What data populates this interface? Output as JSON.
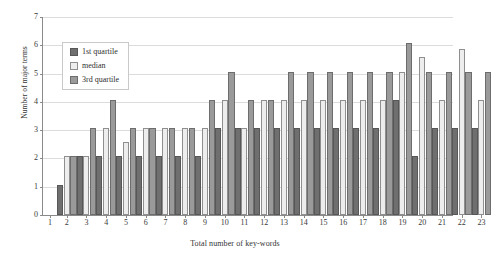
{
  "chart_data": {
    "type": "bar",
    "title": "",
    "xlabel": "Total number of key-words",
    "ylabel": "Number of major terms",
    "categories": [
      1,
      2,
      3,
      4,
      5,
      6,
      7,
      8,
      9,
      10,
      11,
      12,
      13,
      14,
      15,
      16,
      17,
      18,
      19,
      20,
      21,
      22,
      23
    ],
    "ylim": [
      0,
      7
    ],
    "yticks": [
      0,
      1,
      2,
      3,
      4,
      5,
      6,
      7
    ],
    "grid": true,
    "legend_position": "upper-left-inside",
    "series": [
      {
        "name": "1st quartile",
        "color": "#6f6f6f",
        "values": [
          0,
          1,
          2,
          2,
          2,
          2,
          2,
          2,
          2,
          3,
          3,
          3,
          3,
          3,
          3,
          3,
          3,
          3,
          4,
          2,
          3,
          3,
          3
        ]
      },
      {
        "name": "median",
        "color": "#ededed",
        "values": [
          0,
          2,
          2,
          3,
          2.5,
          3,
          3,
          3,
          3,
          4,
          3,
          4,
          4,
          4,
          4,
          4,
          4,
          4,
          5,
          5.5,
          4,
          5.8,
          4
        ]
      },
      {
        "name": "3rd quartile",
        "color": "#9a9a9a",
        "values": [
          0,
          2,
          3,
          4,
          3,
          3,
          3,
          3,
          4,
          5,
          4,
          4,
          5,
          5,
          5,
          5,
          5,
          5,
          6,
          5,
          5,
          5,
          5
        ]
      }
    ]
  },
  "legend": {
    "entries": [
      {
        "label": "1st quartile"
      },
      {
        "label": "median"
      },
      {
        "label": "3rd quartile"
      }
    ]
  }
}
